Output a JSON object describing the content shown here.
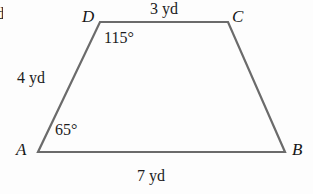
{
  "figure": {
    "type": "trapezoid",
    "shape_name": "quadrilateral-ABCD",
    "stroke_color": "#6b6b6b",
    "background_color": "#fdfdfd",
    "text_color": "#1c1c1c",
    "edge_fragment_text": "d",
    "vertices": [
      {
        "id": "D",
        "label": "D",
        "x": 100,
        "y": 22
      },
      {
        "id": "C",
        "label": "C",
        "x": 228,
        "y": 22
      },
      {
        "id": "B",
        "label": "B",
        "x": 285,
        "y": 152
      },
      {
        "id": "A",
        "label": "A",
        "x": 38,
        "y": 152
      }
    ],
    "sides": [
      {
        "id": "DC",
        "label": "3 yd",
        "length": 3,
        "unit": "yd",
        "position": "top"
      },
      {
        "id": "AD",
        "label": "4 yd",
        "length": 4,
        "unit": "yd",
        "position": "left"
      },
      {
        "id": "AB",
        "label": "7 yd",
        "length": 7,
        "unit": "yd",
        "position": "bottom"
      }
    ],
    "angles": [
      {
        "at": "D",
        "label": "115°",
        "value": 115,
        "unit": "degrees"
      },
      {
        "at": "A",
        "label": "65°",
        "value": 65,
        "unit": "degrees"
      }
    ]
  }
}
